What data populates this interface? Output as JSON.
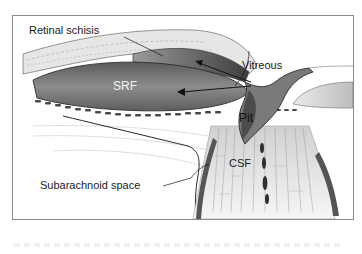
{
  "diagram": {
    "type": "anatomical-illustration",
    "labels": {
      "retinal_schisis": "Retinal schisis",
      "srf": "SRF",
      "vitreous": "Vitreous",
      "pit": "Pit",
      "csf": "CSF",
      "subarachnoid_space": "Subarachnoid space"
    },
    "colors": {
      "frame": "#8a8a8a",
      "fluid_dark": "#4a4a4a",
      "fluid_mid": "#7a7a7a",
      "tissue_light": "#d9d9d9",
      "line": "#1a1a1a"
    }
  }
}
